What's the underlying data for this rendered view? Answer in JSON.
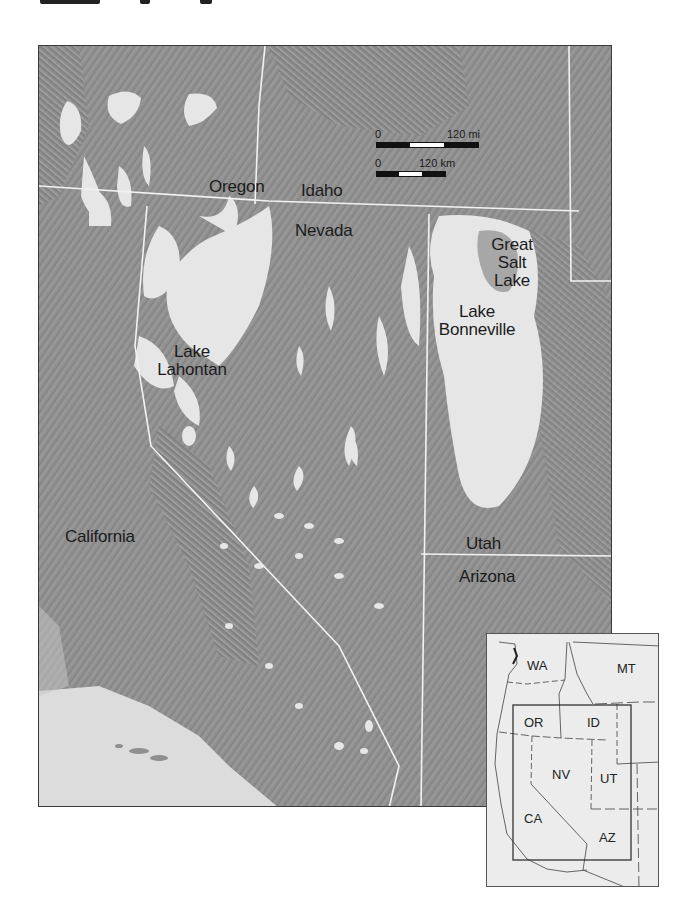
{
  "map": {
    "states": [
      {
        "id": "oregon",
        "label": "Oregon",
        "x": 170,
        "y": 132
      },
      {
        "id": "idaho",
        "label": "Idaho",
        "x": 262,
        "y": 136
      },
      {
        "id": "nevada",
        "label": "Nevada",
        "x": 256,
        "y": 176
      },
      {
        "id": "california",
        "label": "California",
        "x": 26,
        "y": 482
      },
      {
        "id": "utah",
        "label": "Utah",
        "x": 427,
        "y": 489
      },
      {
        "id": "arizona",
        "label": "Arizona",
        "x": 420,
        "y": 522
      }
    ],
    "lakes": [
      {
        "id": "great-salt-lake",
        "lines": [
          "Great",
          "Salt",
          "Lake"
        ],
        "x": 443,
        "y": 190
      },
      {
        "id": "lake-bonneville",
        "lines": [
          "Lake",
          "Bonneville"
        ],
        "x": 393,
        "y": 257
      },
      {
        "id": "lake-lahontan",
        "lines": [
          "Lake",
          "Lahontan"
        ],
        "x": 115,
        "y": 297
      }
    ],
    "scale": {
      "miles": {
        "start": "0",
        "end": "120 mi"
      },
      "km": {
        "start": "0",
        "end": "120 km"
      }
    }
  },
  "inset": {
    "states": [
      {
        "label": "WA",
        "x": 40,
        "y": 32
      },
      {
        "label": "MT",
        "x": 130,
        "y": 36
      },
      {
        "label": "OR",
        "x": 37,
        "y": 86
      },
      {
        "label": "ID",
        "x": 102,
        "y": 86
      },
      {
        "label": "NV",
        "x": 68,
        "y": 139
      },
      {
        "label": "UT",
        "x": 113,
        "y": 143
      },
      {
        "label": "CA",
        "x": 39,
        "y": 183
      },
      {
        "label": "AZ",
        "x": 113,
        "y": 202
      }
    ]
  },
  "colors": {
    "terrain": "#8f8f8f",
    "lake": "#e6e6e6",
    "ocean": "#dcdcdc",
    "border": "#f2f2f2",
    "text": "#1b1b1b"
  }
}
